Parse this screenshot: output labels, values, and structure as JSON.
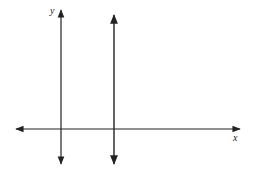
{
  "diagram": {
    "type": "coordinate-plane",
    "axes": {
      "x_label": "x",
      "y_label": "y"
    },
    "lines": [
      {
        "name": "y-axis",
        "orientation": "vertical",
        "x": 61,
        "y1": 10,
        "y2": 165,
        "arrows": "both"
      },
      {
        "name": "vertical-line",
        "orientation": "vertical",
        "x": 114,
        "y1": 15,
        "y2": 165,
        "arrows": "both"
      },
      {
        "name": "x-axis",
        "orientation": "horizontal",
        "y": 129,
        "x1": 15,
        "x2": 240,
        "arrows": "both"
      }
    ],
    "colors": {
      "line": "#222222",
      "background": "#ffffff"
    }
  }
}
